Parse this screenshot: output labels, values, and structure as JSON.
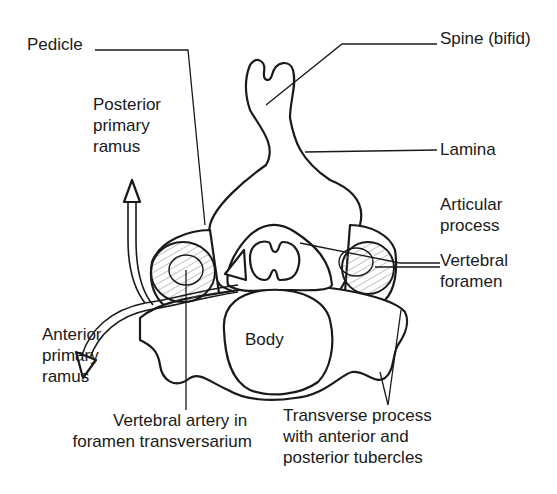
{
  "diagram": {
    "colors": {
      "ink": "#1a1a1a",
      "background": "#ffffff"
    },
    "structure_label": "Body",
    "labels": {
      "pedicle": "Pedicle",
      "spine": "Spine (bifid)",
      "posterior_ramus": [
        "Posterior",
        "primary",
        "ramus"
      ],
      "lamina": "Lamina",
      "articular": [
        "Articular",
        "process"
      ],
      "vertebral_foramen": [
        "Vertebral",
        "foramen"
      ],
      "anterior_ramus": [
        "Anterior",
        "primary",
        "ramus"
      ],
      "vertebral_artery": [
        "Vertebral artery in",
        "foramen transversarium"
      ],
      "transverse_process": [
        "Transverse process",
        "with anterior and",
        "posterior tubercles"
      ]
    }
  }
}
